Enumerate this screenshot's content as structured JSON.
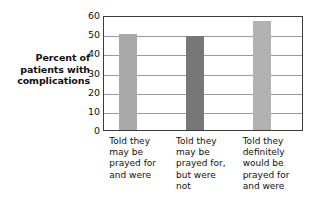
{
  "chart_data": {
    "type": "bar",
    "title": "",
    "subtitle": "",
    "xlabel": "",
    "ylabel": "Percent of patients with complications",
    "ylabel_lines": [
      "Percent of",
      "patients with",
      "complications"
    ],
    "ylim": [
      0,
      60
    ],
    "ytick_labels": [
      "0",
      "10",
      "20",
      "30",
      "40",
      "50",
      "60"
    ],
    "ytick_values": [
      0,
      10,
      20,
      30,
      40,
      50,
      60
    ],
    "grid": true,
    "grid_axis": "y",
    "legend": "none",
    "categories": [
      "Told they may be prayed for and were",
      "Told they may be prayed for, but were not",
      "Told they definitely would be prayed for and were"
    ],
    "category_lines": [
      [
        "Told they",
        "may be",
        "prayed for",
        "and were"
      ],
      [
        "Told they",
        "may be",
        "prayed for,",
        "but were",
        "not"
      ],
      [
        "Told they",
        "definitely",
        "would be",
        "prayed for",
        "and were"
      ]
    ],
    "values": [
      50,
      49,
      57
    ],
    "bar_colors": [
      "#a8a8a8",
      "#777777",
      "#b2b2b2"
    ],
    "axis_color": "#3a3a3a",
    "gridline_color": "#9a9a9a",
    "background": "#ffffff"
  }
}
